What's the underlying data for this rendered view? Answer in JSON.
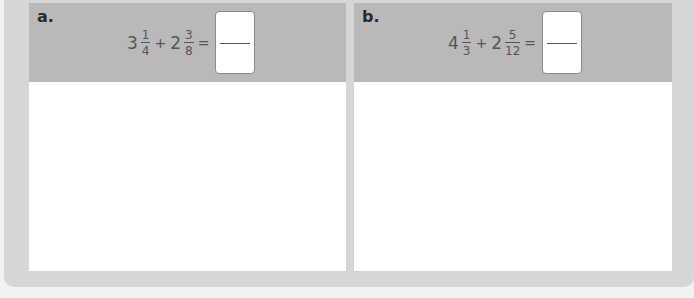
{
  "problems": [
    {
      "label": "a.",
      "term1": {
        "whole": "3",
        "numerator": "1",
        "denominator": "4"
      },
      "operator": "+",
      "term2": {
        "whole": "2",
        "numerator": "3",
        "denominator": "8"
      },
      "equals": "=",
      "answer": {
        "numerator": "",
        "denominator": ""
      }
    },
    {
      "label": "b.",
      "term1": {
        "whole": "4",
        "numerator": "1",
        "denominator": "3"
      },
      "operator": "+",
      "term2": {
        "whole": "2",
        "numerator": "5",
        "denominator": "12"
      },
      "equals": "=",
      "answer": {
        "numerator": "",
        "denominator": ""
      }
    }
  ],
  "colors": {
    "frame": "#d6d6d6",
    "header": "#b9b9b9",
    "workspace": "#ffffff",
    "text": "#555555"
  }
}
